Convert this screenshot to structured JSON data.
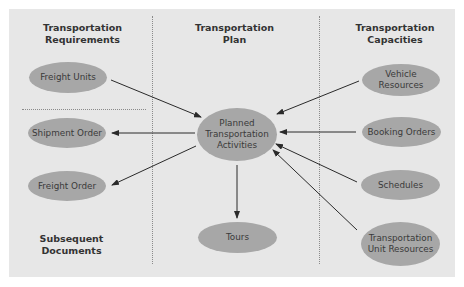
{
  "colors": {
    "background": "#e7e7e7",
    "node_fill": "#a7a7a7",
    "text": "#333333",
    "arrow": "#2a2a2a",
    "divider": "#8a8a8a"
  },
  "columns": {
    "left_heading": "Transportation Requirements",
    "left_heading_line1": "Transportation",
    "left_heading_line2": "Requirements",
    "center_heading_line1": "Transportation",
    "center_heading_line2": "Plan",
    "right_heading_line1": "Transportation",
    "right_heading_line2": "Capacities",
    "bottom_left_heading_line1": "Subsequent",
    "bottom_left_heading_line2": "Documents"
  },
  "nodes": {
    "freight_units": "Freight Units",
    "shipment_order": "Shipment Order",
    "freight_order": "Freight Order",
    "planned_line1": "Planned",
    "planned_line2": "Transportation",
    "planned_line3": "Activities",
    "tours": "Tours",
    "vehicle_line1": "Vehicle",
    "vehicle_line2": "Resources",
    "booking_orders": "Booking Orders",
    "schedules": "Schedules",
    "tur_line1": "Transportation",
    "tur_line2": "Unit Resources"
  },
  "edges": [
    {
      "from": "Freight Units",
      "to": "Planned Transportation Activities"
    },
    {
      "from": "Planned Transportation Activities",
      "to": "Shipment Order"
    },
    {
      "from": "Planned Transportation Activities",
      "to": "Freight Order"
    },
    {
      "from": "Planned Transportation Activities",
      "to": "Tours"
    },
    {
      "from": "Vehicle Resources",
      "to": "Planned Transportation Activities"
    },
    {
      "from": "Booking Orders",
      "to": "Planned Transportation Activities"
    },
    {
      "from": "Schedules",
      "to": "Planned Transportation Activities"
    },
    {
      "from": "Transportation Unit Resources",
      "to": "Planned Transportation Activities"
    }
  ]
}
